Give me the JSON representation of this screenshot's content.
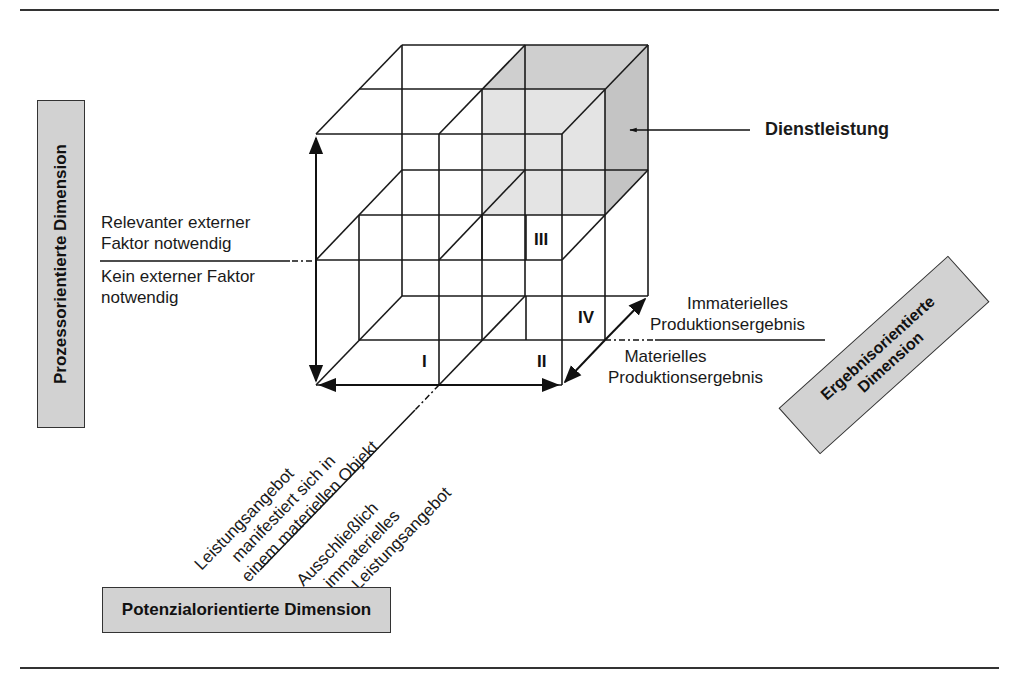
{
  "figure": {
    "dimensions": {
      "process": "Prozessorientierte Dimension",
      "potential": "Potenzialorientierte Dimension",
      "result_line1": "Ergebnisorientierte",
      "result_line2": "Dimension"
    },
    "process_axis": {
      "upper_line1": "Relevanter externer",
      "upper_line2": "Faktor notwendig",
      "lower_line1": "Kein externer Faktor",
      "lower_line2": "notwendig"
    },
    "result_axis": {
      "upper_line1": "Immaterielles",
      "upper_line2": "Produktionsergebnis",
      "lower_line1": "Materielles",
      "lower_line2": "Produktionsergebnis"
    },
    "potential_axis": {
      "upper_line1": "Leistungsangebot",
      "upper_line2": "manifestiert sich in",
      "upper_line3": "einem materiellen Objekt",
      "lower_line1": "Ausschließlich",
      "lower_line2": "immaterielles",
      "lower_line3": "Leistungsangebot"
    },
    "callout": "Dienstleistung",
    "cells": {
      "c1": "I",
      "c2": "II",
      "c3": "III",
      "c4": "IV"
    },
    "colors": {
      "line": "#1a1a1a",
      "box_fill": "#d2d2d2",
      "shade_front": "#e4e4e4",
      "shade_top": "#cfcfcf",
      "shade_side": "#c4c4c4"
    }
  }
}
